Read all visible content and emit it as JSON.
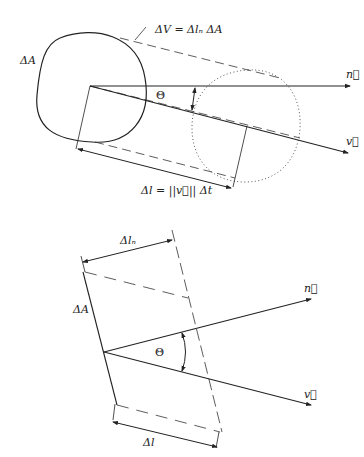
{
  "figure": {
    "top_panel": {
      "labels": {
        "area": "ΔA",
        "volume_eq": "ΔV = Δlₙ ΔA",
        "normal": "n⃗",
        "velocity": "v⃗",
        "angle": "Θ",
        "length_eq": "Δl = ||v⃗|| Δt"
      }
    },
    "bottom_panel": {
      "labels": {
        "normal_length": "Δlₙ",
        "area": "ΔA",
        "normal": "n⃗",
        "velocity": "v⃗",
        "angle": "Θ",
        "length": "Δl"
      }
    },
    "colors": {
      "stroke": "#222222",
      "background": "#ffffff"
    }
  }
}
